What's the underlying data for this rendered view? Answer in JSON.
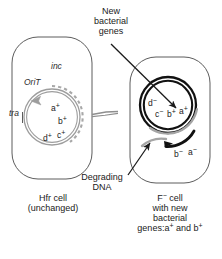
{
  "figure": {
    "background_color": "#ffffff",
    "ink_color": "#1a1a1a",
    "gray_color": "#9a9a9a"
  },
  "callouts": {
    "new_genes": "New\nbacterial\ngenes",
    "degrading_dna": "Degrading\nDNA"
  },
  "left_cell": {
    "caption": "Hfr cell\n(unchanged)",
    "plasmid_labels": {
      "inc": "inc",
      "orit": "OriT",
      "tra": "tra"
    },
    "genes": [
      {
        "letter": "a",
        "charge": "+"
      },
      {
        "letter": "b",
        "charge": "+"
      },
      {
        "letter": "c",
        "charge": "+"
      },
      {
        "letter": "d",
        "charge": "+"
      }
    ]
  },
  "right_cell": {
    "caption": "F",
    "caption_charge": "−",
    "caption_rest": " cell\nwith new\nbacterial\ngenes:",
    "caption_genes_a": "a",
    "caption_genes_mid": " and b",
    "chromosome_genes": [
      {
        "letter": "d",
        "charge": "−"
      },
      {
        "letter": "c",
        "charge": "−"
      },
      {
        "letter": "b",
        "charge": "+"
      },
      {
        "letter": "a",
        "charge": "+"
      }
    ],
    "fragment_genes": [
      {
        "letter": "b",
        "charge": "−"
      },
      {
        "letter": "a",
        "charge": "−"
      }
    ]
  },
  "icons": {
    "bridge": "conjugation-bridge-icon",
    "orit_arrow": "orit-direction-arrowhead-icon",
    "new_genes_arrow": "new-genes-pointer-arrow-icon",
    "degrading_arrow": "degrading-dna-pointer-arrow-icon",
    "fragment_arrow": "fragment-direction-arrowhead-icon"
  }
}
